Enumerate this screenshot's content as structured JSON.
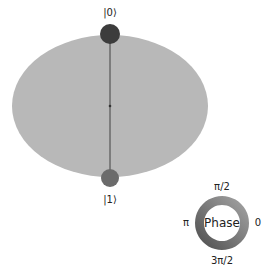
{
  "diagram": {
    "type": "qsphere",
    "sphere": {
      "cx": 110,
      "cy": 106,
      "rx": 98,
      "ry": 71,
      "fill": "#b8b8b8"
    },
    "axis": {
      "x": 110,
      "y1": 34,
      "y2": 178,
      "color": "#555555"
    },
    "states": [
      {
        "label": "|0⟩",
        "cx": 110,
        "cy": 34,
        "r": 10,
        "color": "#3c3c3c",
        "label_x": 110,
        "label_y": 13
      },
      {
        "label": "|1⟩",
        "cx": 110,
        "cy": 178,
        "r": 9,
        "color": "#6b6b6b",
        "label_x": 110,
        "label_y": 200
      }
    ]
  },
  "phase_legend": {
    "title": "Phase",
    "labels": {
      "top": "π/2",
      "left": "π",
      "right": "0",
      "bottom": "3π/2"
    },
    "ring": {
      "cx": 222,
      "cy": 223,
      "outer_r": 27,
      "inner_r": 18
    }
  }
}
